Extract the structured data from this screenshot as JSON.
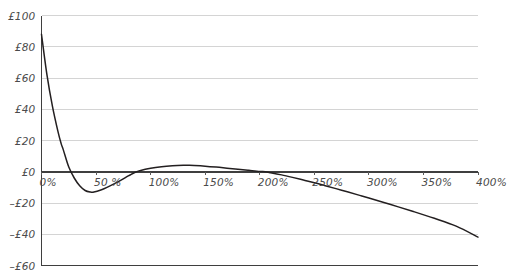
{
  "chart_data": {
    "type": "line",
    "title": "",
    "subtitle": "",
    "xlabel": "",
    "ylabel": "",
    "grid": true,
    "legend": null,
    "legend_position": "none",
    "xlim": [
      0,
      400
    ],
    "ylim": [
      -60,
      100
    ],
    "x_tick_labels": [
      "0%",
      "50 %",
      "100%",
      "150%",
      "200%",
      "250%",
      "300%",
      "350%",
      "400%"
    ],
    "x_tick_values": [
      0,
      50,
      100,
      150,
      200,
      250,
      300,
      350,
      400
    ],
    "y_tick_labels": [
      "£100",
      "£80",
      "£60",
      "£40",
      "£20",
      "£0",
      "–£20",
      "–£40",
      "–£60"
    ],
    "y_tick_values": [
      100,
      80,
      60,
      40,
      20,
      0,
      -20,
      -40,
      -60
    ],
    "zero_line_value": 0,
    "series": [
      {
        "name": "value",
        "color": "#231f20",
        "x": [
          0,
          5,
          10,
          15,
          18,
          20,
          25,
          30,
          35,
          40,
          45,
          48,
          55,
          60,
          70,
          80,
          85,
          90,
          100,
          110,
          120,
          130,
          135,
          140,
          150,
          160,
          170,
          180,
          190,
          200,
          205,
          210,
          220,
          230,
          240,
          250,
          260,
          275,
          290,
          300,
          320,
          340,
          360,
          380,
          400
        ],
        "y": [
          88,
          62,
          42,
          26,
          18,
          14,
          3,
          -4,
          -9,
          -12,
          -13,
          -13,
          -11.5,
          -10,
          -6.5,
          -2.5,
          -0.6,
          0.6,
          2.2,
          3.2,
          3.8,
          4.1,
          4.1,
          4,
          3.6,
          3,
          2.3,
          1.6,
          0.9,
          0.2,
          0,
          -0.6,
          -2,
          -3.6,
          -5.3,
          -7,
          -8.9,
          -11.8,
          -14.8,
          -16.8,
          -21,
          -25.3,
          -29.8,
          -34.8,
          -41.8
        ]
      }
    ]
  },
  "axes": {
    "currency_symbol": "£",
    "percent_symbol": "%"
  }
}
